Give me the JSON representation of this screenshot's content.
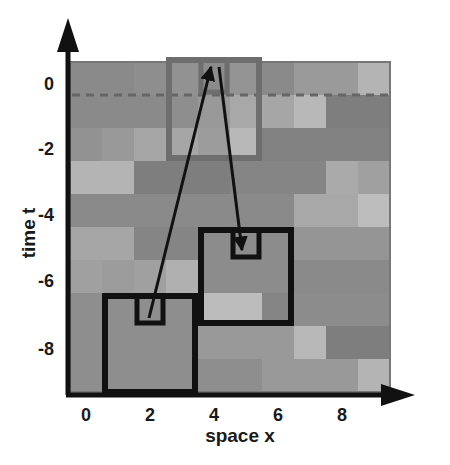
{
  "figure": {
    "type": "spacetime-grid-diagram",
    "xlabel": "space x",
    "ylabel": "time t",
    "x_ticks": [
      "0",
      "2",
      "4",
      "6",
      "8"
    ],
    "y_ticks": [
      "0",
      "-2",
      "-4",
      "-6",
      "-8"
    ],
    "grid": {
      "cols": 10,
      "rows": 10,
      "shades": [
        [
          "#8a8a8a",
          "#8a8a8a",
          "#8e8e8e",
          "#929292",
          "#8c8c8c",
          "#949494",
          "#8a8a8a",
          "#9a9a9a",
          "#9a9a9a",
          "#b4b4b4"
        ],
        [
          "#8a8a8a",
          "#8a8a8a",
          "#8a8a8a",
          "#8e8e8e",
          "#999999",
          "#a8a8a8",
          "#a6a6a6",
          "#b8b8b8",
          "#7e7e7e",
          "#7e7e7e"
        ],
        [
          "#929292",
          "#999999",
          "#a6a6a6",
          "#a6a6a6",
          "#9c9c9c",
          "#b8b8b8",
          "#828282",
          "#828282",
          "#828282",
          "#828282"
        ],
        [
          "#b4b4b4",
          "#b4b4b4",
          "#7e7e7e",
          "#7e7e7e",
          "#7e7e7e",
          "#858585",
          "#858585",
          "#858585",
          "#aaaaaa",
          "#a0a0a0"
        ],
        [
          "#8a8a8a",
          "#8a8a8a",
          "#8a8a8a",
          "#8a8a8a",
          "#8a8a8a",
          "#8a8a8a",
          "#8a8a8a",
          "#a8a8a8",
          "#a8a8a8",
          "#bdbdbd"
        ],
        [
          "#a6a6a6",
          "#a6a6a6",
          "#858585",
          "#858585",
          "#8c8c8c",
          "#8c8c8c",
          "#8c8c8c",
          "#959595",
          "#959595",
          "#959595"
        ],
        [
          "#a0a0a0",
          "#9c9c9c",
          "#a0a0a0",
          "#b0b0b0",
          "#8c8c8c",
          "#8c8c8c",
          "#8c8c8c",
          "#8a8a8a",
          "#8a8a8a",
          "#8a8a8a"
        ],
        [
          "#8e8e8e",
          "#8e8e8e",
          "#8e8e8e",
          "#8e8e8e",
          "#bcbcbc",
          "#bcbcbc",
          "#858585",
          "#8c8c8c",
          "#8c8c8c",
          "#8c8c8c"
        ],
        [
          "#8e8e8e",
          "#8e8e8e",
          "#8e8e8e",
          "#8e8e8e",
          "#999999",
          "#999999",
          "#999999",
          "#b8b8b8",
          "#7e7e7e",
          "#7e7e7e"
        ],
        [
          "#8e8e8e",
          "#8e8e8e",
          "#8e8e8e",
          "#8e8e8e",
          "#8e8e8e",
          "#8e8e8e",
          "#999999",
          "#999999",
          "#999999",
          "#b4b4b4"
        ]
      ]
    },
    "dashed_line_color": "#666666",
    "boxes": [
      {
        "id": "target-outer",
        "color": "#6e6e6e",
        "col": 3,
        "row": 0,
        "w": 3,
        "h": 3
      },
      {
        "id": "target-inner",
        "color": "#6e6e6e",
        "col": 4,
        "row": 0,
        "w": 1,
        "h": 1
      },
      {
        "id": "source-a-outer",
        "color": "#111111",
        "col": 1,
        "row": 7,
        "w": 3,
        "h": 3
      },
      {
        "id": "source-a-inner",
        "color": "#111111",
        "col": 2,
        "row": 7,
        "w": 1,
        "h": 1
      },
      {
        "id": "source-b-outer",
        "color": "#111111",
        "col": 4,
        "row": 5,
        "w": 3,
        "h": 3
      },
      {
        "id": "source-b-inner",
        "color": "#111111",
        "col": 5,
        "row": 5,
        "w": 1,
        "h": 1
      }
    ],
    "arrows": [
      {
        "id": "arrow-up",
        "x1": 149,
        "y1": 318,
        "x2": 211,
        "y2": 67
      },
      {
        "id": "arrow-down",
        "x1": 219,
        "y1": 67,
        "x2": 242,
        "y2": 250
      }
    ]
  }
}
